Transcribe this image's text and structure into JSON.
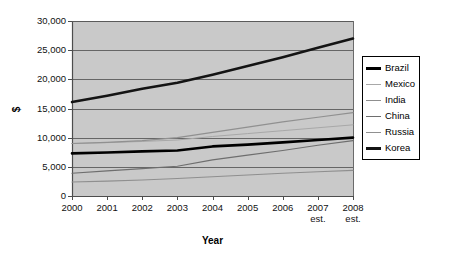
{
  "chart_data": {
    "type": "line",
    "title": "",
    "xlabel": "Year",
    "ylabel": "$",
    "x": [
      "2000",
      "2001",
      "2002",
      "2003",
      "2004",
      "2005",
      "2006",
      "2007",
      "2008"
    ],
    "x_tick_sublabels": [
      "",
      "",
      "",
      "",
      "",
      "",
      "",
      "est.",
      "est."
    ],
    "xlim": [
      2000,
      2008
    ],
    "ylim": [
      0,
      30000
    ],
    "yticks": [
      0,
      5000,
      10000,
      15000,
      20000,
      25000,
      30000
    ],
    "ytick_labels": [
      "0",
      "5,000",
      "10,000",
      "15,000",
      "20,000",
      "25,000",
      "30,000"
    ],
    "grid": true,
    "legend_position": "right",
    "plot_bgcolor": "#c9c9c9",
    "page_bgcolor": "#ffffff",
    "gridline_color": "#5a5a5a",
    "axis_color": "#4d4d4d",
    "series": [
      {
        "name": "Brazil",
        "color": "#000000",
        "width": 2.6,
        "values": [
          7300,
          7450,
          7650,
          7800,
          8500,
          8800,
          9200,
          9600,
          10000
        ]
      },
      {
        "name": "Mexico",
        "color": "#a8a8a8",
        "width": 1.0,
        "values": [
          9000,
          9150,
          9350,
          9600,
          10200,
          10700,
          11200,
          11700,
          12200
        ]
      },
      {
        "name": "India",
        "color": "#8f8f8f",
        "width": 1.1,
        "values": [
          2400,
          2550,
          2750,
          3000,
          3300,
          3600,
          3900,
          4150,
          4400
        ]
      },
      {
        "name": "China",
        "color": "#6e6e6e",
        "width": 1.2,
        "values": [
          3900,
          4300,
          4700,
          5100,
          6200,
          7000,
          7800,
          8700,
          9500
        ]
      },
      {
        "name": "Russia",
        "color": "#909090",
        "width": 1.2,
        "values": [
          9000,
          9200,
          9500,
          10000,
          10900,
          11800,
          12700,
          13500,
          14300
        ]
      },
      {
        "name": "Korea",
        "color": "#141414",
        "width": 2.6,
        "values": [
          16100,
          17200,
          18400,
          19400,
          20800,
          22300,
          23800,
          25400,
          27000
        ]
      }
    ]
  }
}
